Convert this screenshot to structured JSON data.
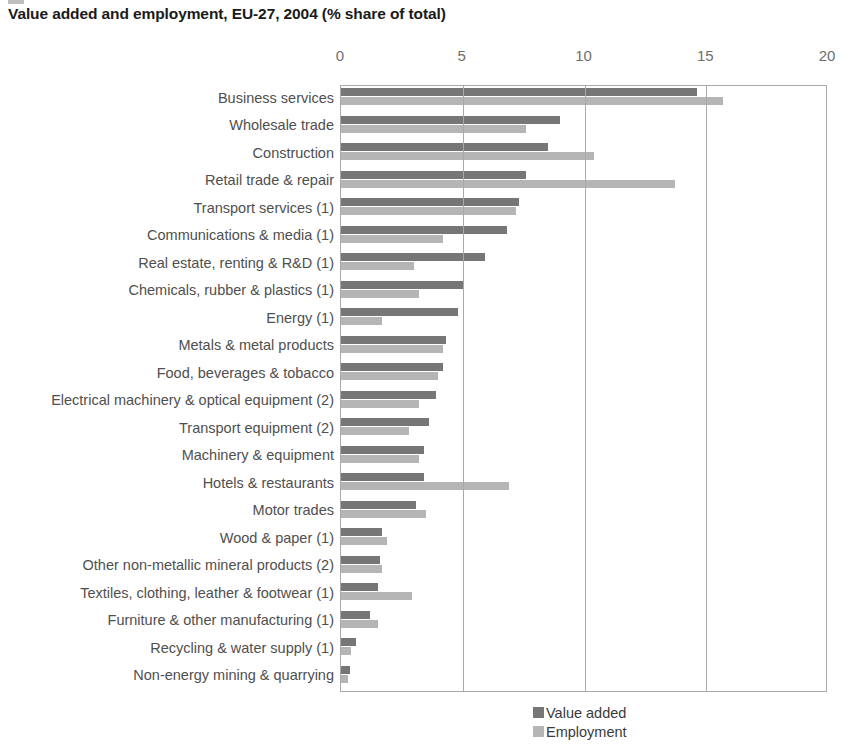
{
  "chart_data": {
    "type": "bar",
    "orientation": "horizontal",
    "title": "Value added and employment, EU-27, 2004 (% share of total)",
    "xlabel": "",
    "ylabel": "",
    "xlim": [
      0,
      20
    ],
    "xticks": [
      "0",
      "5",
      "10",
      "15",
      "20"
    ],
    "grid": true,
    "legend_position": "bottom-right",
    "categories": [
      "Business services",
      "Wholesale trade",
      "Construction",
      "Retail trade & repair",
      "Transport services (1)",
      "Communications & media (1)",
      "Real estate, renting & R&D (1)",
      "Chemicals, rubber & plastics (1)",
      "Energy (1)",
      "Metals & metal products",
      "Food, beverages & tobacco",
      "Electrical machinery & optical equipment (2)",
      "Transport equipment (2)",
      "Machinery & equipment",
      "Hotels & restaurants",
      "Motor trades",
      "Wood & paper (1)",
      "Other non-metallic mineral products (2)",
      "Textiles, clothing, leather & footwear (1)",
      "Furniture & other manufacturing (1)",
      "Recycling & water supply (1)",
      "Non-energy mining & quarrying"
    ],
    "series": [
      {
        "name": "Value added",
        "color": "#767676",
        "values": [
          14.6,
          9.0,
          8.5,
          7.6,
          7.3,
          6.8,
          5.9,
          5.0,
          4.8,
          4.3,
          4.2,
          3.9,
          3.6,
          3.4,
          3.4,
          3.1,
          1.7,
          1.6,
          1.5,
          1.2,
          0.6,
          0.35
        ]
      },
      {
        "name": "Employment",
        "color": "#b5b5b5",
        "values": [
          15.7,
          7.6,
          10.4,
          13.7,
          7.2,
          4.2,
          3.0,
          3.2,
          1.7,
          4.2,
          4.0,
          3.2,
          2.8,
          3.2,
          6.9,
          3.5,
          1.9,
          1.7,
          2.9,
          1.5,
          0.4,
          0.3
        ]
      }
    ]
  }
}
